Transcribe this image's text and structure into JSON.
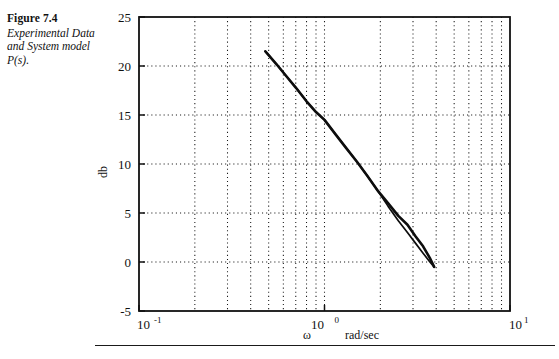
{
  "caption": {
    "figure_number": "Figure 7.4",
    "description": "Experimental Data and System model P(s)."
  },
  "axes": {
    "ylabel": "db",
    "xlabel_omega": "ω",
    "xlabel_units": "rad/sec",
    "y_ticks": [
      "-5",
      "0",
      "5",
      "10",
      "15",
      "20",
      "25"
    ],
    "x_tick_mantissas": [
      "10",
      "10",
      "10"
    ],
    "x_tick_exponents": [
      "-1",
      "0",
      "1"
    ]
  },
  "chart_data": {
    "type": "line",
    "title": "Experimental Data and System model P(s).",
    "xlabel": "ω  rad/sec",
    "ylabel": "db",
    "xscale": "log",
    "xlim": [
      0.1,
      10
    ],
    "ylim": [
      -5,
      25
    ],
    "ytick_values": [
      -5,
      0,
      5,
      10,
      15,
      20,
      25
    ],
    "xtick_values": [
      0.1,
      1,
      10
    ],
    "grid": "dotted-both-major-and-minor",
    "legend": "none",
    "series": [
      {
        "name": "Experimental Data",
        "x": [
          0.48,
          0.55,
          0.62,
          0.7,
          0.8,
          0.9,
          1.0,
          1.15,
          1.3,
          1.5,
          1.7,
          1.95,
          2.2,
          2.5,
          2.8,
          3.1,
          3.4,
          3.7,
          3.9
        ],
        "y": [
          21.5,
          20.2,
          19.0,
          17.8,
          16.4,
          15.3,
          14.5,
          13.0,
          11.7,
          10.2,
          8.8,
          7.2,
          6.0,
          4.7,
          3.8,
          2.6,
          1.6,
          0.4,
          -0.5
        ]
      },
      {
        "name": "System model P(s)",
        "x": [
          0.48,
          0.55,
          0.62,
          0.7,
          0.8,
          0.9,
          1.0,
          1.15,
          1.3,
          1.5,
          1.7,
          1.95,
          2.2,
          2.5,
          2.8,
          3.1,
          3.4,
          3.7,
          3.9
        ],
        "y": [
          21.5,
          20.2,
          19.0,
          17.8,
          16.4,
          15.3,
          14.5,
          13.0,
          11.7,
          10.2,
          8.8,
          7.2,
          5.7,
          4.2,
          3.0,
          1.9,
          0.9,
          0.0,
          -0.5
        ]
      }
    ]
  }
}
